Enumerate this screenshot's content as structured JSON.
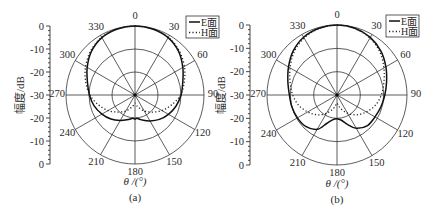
{
  "figure": {
    "ylabel": "幅度/dB",
    "xlabel": "θ /(°)",
    "radial_tick_labels": [
      "0",
      "-10",
      "-20",
      "-30",
      "-20",
      "-10",
      "0"
    ],
    "angle_labels": [
      "0",
      "30",
      "60",
      "90",
      "120",
      "150",
      "180",
      "210",
      "240",
      "270",
      "300",
      "330"
    ],
    "legend": [
      {
        "label": "E面",
        "style": "solid"
      },
      {
        "label": "H面",
        "style": "dotted"
      }
    ],
    "panels": [
      {
        "caption": "(a)"
      },
      {
        "caption": "(b)"
      }
    ]
  },
  "chart_data": [
    {
      "type": "polar-line",
      "title": "(a)",
      "xlabel": "θ /(°)",
      "ylabel": "幅度/dB",
      "rlim": [
        -30,
        0
      ],
      "r_ticks": [
        0,
        -10,
        -20,
        -30
      ],
      "theta_ticks": [
        0,
        30,
        60,
        90,
        120,
        150,
        180,
        210,
        240,
        270,
        300,
        330
      ],
      "theta_direction": "clockwise",
      "theta_zero": "top",
      "legend_position": "upper right",
      "grid": true,
      "series": [
        {
          "name": "E面",
          "theta": [
            0,
            15,
            30,
            45,
            60,
            75,
            90,
            105,
            120,
            135,
            150,
            165,
            175,
            180,
            185,
            195,
            210,
            225,
            240,
            255,
            270,
            285,
            300,
            315,
            330,
            345,
            360
          ],
          "values": [
            0,
            -0.3,
            -1.2,
            -3.2,
            -6.0,
            -8.5,
            -10.0,
            -11.5,
            -13.2,
            -15.0,
            -17.0,
            -18.8,
            -19.8,
            -19.5,
            -19.8,
            -19.0,
            -17.2,
            -15.2,
            -13.4,
            -11.6,
            -10.2,
            -8.6,
            -6.0,
            -3.2,
            -1.2,
            -0.3,
            0
          ]
        },
        {
          "name": "H面",
          "theta": [
            0,
            15,
            30,
            45,
            60,
            75,
            90,
            105,
            120,
            135,
            150,
            165,
            175,
            180,
            185,
            195,
            210,
            225,
            240,
            255,
            270,
            285,
            300,
            315,
            330,
            345,
            360
          ],
          "values": [
            0,
            -0.3,
            -1.0,
            -2.8,
            -5.2,
            -7.8,
            -10.2,
            -13.5,
            -16.5,
            -19.5,
            -22.0,
            -24.5,
            -26.0,
            -26.5,
            -26.0,
            -24.5,
            -22.0,
            -19.5,
            -16.5,
            -13.5,
            -10.4,
            -7.8,
            -5.2,
            -2.8,
            -1.0,
            -0.3,
            0
          ]
        }
      ]
    },
    {
      "type": "polar-line",
      "title": "(b)",
      "xlabel": "θ /(°)",
      "ylabel": "幅度/dB",
      "rlim": [
        -30,
        0
      ],
      "r_ticks": [
        0,
        -10,
        -20,
        -30
      ],
      "theta_ticks": [
        0,
        30,
        60,
        90,
        120,
        150,
        180,
        210,
        240,
        270,
        300,
        330
      ],
      "theta_direction": "clockwise",
      "theta_zero": "top",
      "legend_position": "upper right",
      "grid": true,
      "series": [
        {
          "name": "E面",
          "theta": [
            0,
            15,
            30,
            45,
            60,
            75,
            90,
            105,
            120,
            135,
            150,
            160,
            170,
            180,
            190,
            200,
            210,
            225,
            240,
            255,
            270,
            285,
            300,
            315,
            330,
            345,
            360
          ],
          "values": [
            0,
            -0.4,
            -1.5,
            -3.4,
            -5.8,
            -8.0,
            -9.5,
            -10.5,
            -11.2,
            -11.5,
            -13.5,
            -16.5,
            -19.0,
            -19.8,
            -19.2,
            -17.0,
            -13.0,
            -11.0,
            -10.4,
            -10.0,
            -9.6,
            -8.2,
            -6.0,
            -3.4,
            -1.4,
            -0.4,
            0
          ]
        },
        {
          "name": "H面",
          "theta": [
            0,
            15,
            30,
            45,
            60,
            75,
            90,
            105,
            120,
            135,
            150,
            165,
            175,
            180,
            185,
            195,
            210,
            225,
            240,
            255,
            270,
            285,
            300,
            315,
            330,
            345,
            360
          ],
          "values": [
            0,
            -0.5,
            -1.8,
            -4.0,
            -6.8,
            -9.2,
            -11.0,
            -13.0,
            -15.5,
            -18.0,
            -21.0,
            -24.0,
            -26.0,
            -26.5,
            -26.0,
            -24.0,
            -21.0,
            -18.0,
            -15.5,
            -13.0,
            -11.0,
            -9.2,
            -6.8,
            -4.0,
            -1.8,
            -0.5,
            0
          ]
        }
      ]
    }
  ]
}
